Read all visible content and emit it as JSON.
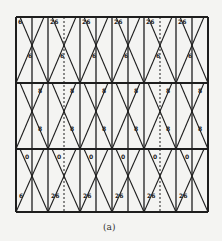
{
  "figure": {
    "caption": "(a)",
    "frame": {
      "left": 16,
      "top": 17,
      "right": 208,
      "bottom": 212
    },
    "row_lines_y": [
      17,
      83,
      149,
      212
    ],
    "vertical_lines": [
      {
        "x": 16,
        "dashed": false
      },
      {
        "x": 32,
        "dashed": false
      },
      {
        "x": 48,
        "dashed": false
      },
      {
        "x": 64,
        "dashed": true
      },
      {
        "x": 80,
        "dashed": false
      },
      {
        "x": 96,
        "dashed": false
      },
      {
        "x": 112,
        "dashed": false
      },
      {
        "x": 128,
        "dashed": false
      },
      {
        "x": 144,
        "dashed": false
      },
      {
        "x": 160,
        "dashed": true
      },
      {
        "x": 176,
        "dashed": false
      },
      {
        "x": 192,
        "dashed": false
      },
      {
        "x": 208,
        "dashed": false
      }
    ],
    "labels": {
      "top_row_top": [
        "6",
        "26",
        "26",
        "26",
        "26",
        "26"
      ],
      "top_row_mid": [
        "6",
        "6",
        "6",
        "6",
        "6",
        "6"
      ],
      "mid_row_top": [
        "8",
        "8",
        "8",
        "8",
        "8",
        "8"
      ],
      "mid_row_mid": [
        "8",
        "8",
        "8",
        "8",
        "8",
        "8"
      ],
      "bot_row_top": [
        "0",
        "0",
        "0",
        "0",
        "0",
        "0"
      ],
      "bot_row_bottom": [
        "6",
        "26",
        "26",
        "26",
        "26",
        "26"
      ]
    },
    "line_color": "#1e1e1e"
  }
}
